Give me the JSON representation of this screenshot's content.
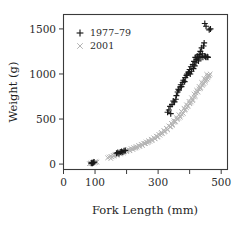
{
  "chart_data": {
    "type": "scatter",
    "title": "",
    "xlabel": "Fork Length (mm)",
    "ylabel": "Weight (g)",
    "xlim": [
      0,
      520
    ],
    "ylim": [
      -60,
      1660
    ],
    "xticks": [
      0,
      100,
      200,
      300,
      400,
      500
    ],
    "xticklabels": [
      "0",
      "100",
      "",
      "300",
      "",
      "500"
    ],
    "yticks": [
      0,
      500,
      1000,
      1500
    ],
    "yticklabels": [
      "0",
      "500",
      "1000",
      "1500"
    ],
    "grid": false,
    "legend_position": "upper-left-inside",
    "series": [
      {
        "name": "1977–79",
        "marker": "plus",
        "color": "#1a1a1a",
        "points": [
          [
            88,
            10
          ],
          [
            90,
            14
          ],
          [
            92,
            8
          ],
          [
            95,
            18
          ],
          [
            97,
            22
          ],
          [
            168,
            120
          ],
          [
            172,
            128
          ],
          [
            176,
            118
          ],
          [
            180,
            135
          ],
          [
            184,
            140
          ],
          [
            188,
            132
          ],
          [
            192,
            148
          ],
          [
            196,
            152
          ],
          [
            330,
            575
          ],
          [
            334,
            600
          ],
          [
            338,
            640
          ],
          [
            340,
            560
          ],
          [
            344,
            660
          ],
          [
            348,
            700
          ],
          [
            352,
            690
          ],
          [
            356,
            720
          ],
          [
            358,
            760
          ],
          [
            362,
            800
          ],
          [
            364,
            830
          ],
          [
            366,
            820
          ],
          [
            370,
            855
          ],
          [
            372,
            880
          ],
          [
            374,
            860
          ],
          [
            378,
            905
          ],
          [
            380,
            930
          ],
          [
            384,
            915
          ],
          [
            386,
            960
          ],
          [
            390,
            985
          ],
          [
            392,
            1000
          ],
          [
            396,
            1020
          ],
          [
            398,
            1010
          ],
          [
            400,
            1050
          ],
          [
            402,
            1000
          ],
          [
            404,
            1080
          ],
          [
            406,
            1030
          ],
          [
            410,
            1105
          ],
          [
            412,
            1060
          ],
          [
            414,
            1140
          ],
          [
            416,
            1090
          ],
          [
            418,
            1185
          ],
          [
            420,
            1125
          ],
          [
            422,
            1160
          ],
          [
            424,
            1200
          ],
          [
            426,
            1180
          ],
          [
            428,
            1145
          ],
          [
            430,
            1215
          ],
          [
            432,
            1190
          ],
          [
            434,
            1250
          ],
          [
            436,
            1185
          ],
          [
            438,
            1290
          ],
          [
            440,
            1225
          ],
          [
            442,
            1185
          ],
          [
            444,
            1310
          ],
          [
            446,
            1345
          ],
          [
            448,
            1200
          ],
          [
            450,
            1190
          ],
          [
            452,
            1185
          ],
          [
            456,
            1190
          ],
          [
            458,
            1185
          ],
          [
            448,
            1560
          ],
          [
            452,
            1530
          ],
          [
            462,
            1490
          ],
          [
            466,
            1500
          ]
        ]
      },
      {
        "name": "2001",
        "marker": "cross",
        "color": "#b4b4b4",
        "points": [
          [
            82,
            5
          ],
          [
            85,
            8
          ],
          [
            87,
            12
          ],
          [
            89,
            6
          ],
          [
            91,
            16
          ],
          [
            93,
            10
          ],
          [
            95,
            20
          ],
          [
            97,
            14
          ],
          [
            99,
            24
          ],
          [
            101,
            18
          ],
          [
            103,
            28
          ],
          [
            106,
            22
          ],
          [
            140,
            70
          ],
          [
            145,
            78
          ],
          [
            150,
            86
          ],
          [
            154,
            80
          ],
          [
            158,
            95
          ],
          [
            162,
            100
          ],
          [
            166,
            110
          ],
          [
            170,
            105
          ],
          [
            174,
            122
          ],
          [
            178,
            118
          ],
          [
            182,
            130
          ],
          [
            186,
            126
          ],
          [
            190,
            140
          ],
          [
            194,
            136
          ],
          [
            198,
            150
          ],
          [
            202,
            146
          ],
          [
            206,
            160
          ],
          [
            210,
            155
          ],
          [
            214,
            172
          ],
          [
            218,
            166
          ],
          [
            222,
            182
          ],
          [
            226,
            176
          ],
          [
            230,
            194
          ],
          [
            234,
            188
          ],
          [
            238,
            206
          ],
          [
            242,
            200
          ],
          [
            246,
            220
          ],
          [
            250,
            212
          ],
          [
            254,
            232
          ],
          [
            258,
            226
          ],
          [
            262,
            246
          ],
          [
            266,
            238
          ],
          [
            270,
            260
          ],
          [
            274,
            252
          ],
          [
            278,
            276
          ],
          [
            282,
            268
          ],
          [
            286,
            292
          ],
          [
            290,
            284
          ],
          [
            294,
            310
          ],
          [
            298,
            300
          ],
          [
            302,
            330
          ],
          [
            306,
            320
          ],
          [
            310,
            352
          ],
          [
            314,
            340
          ],
          [
            318,
            374
          ],
          [
            322,
            362
          ],
          [
            326,
            398
          ],
          [
            330,
            386
          ],
          [
            334,
            424
          ],
          [
            338,
            412
          ],
          [
            342,
            452
          ],
          [
            346,
            440
          ],
          [
            350,
            482
          ],
          [
            354,
            468
          ],
          [
            358,
            514
          ],
          [
            362,
            500
          ],
          [
            366,
            548
          ],
          [
            370,
            534
          ],
          [
            374,
            584
          ],
          [
            378,
            568
          ],
          [
            382,
            620
          ],
          [
            386,
            604
          ],
          [
            390,
            658
          ],
          [
            394,
            640
          ],
          [
            398,
            696
          ],
          [
            402,
            678
          ],
          [
            406,
            736
          ],
          [
            410,
            716
          ],
          [
            414,
            778
          ],
          [
            418,
            756
          ],
          [
            422,
            820
          ],
          [
            426,
            798
          ],
          [
            430,
            862
          ],
          [
            434,
            840
          ],
          [
            438,
            906
          ],
          [
            442,
            884
          ],
          [
            446,
            950
          ],
          [
            450,
            928
          ],
          [
            454,
            996
          ],
          [
            458,
            972
          ],
          [
            150,
            62
          ],
          [
            160,
            88
          ],
          [
            170,
            96
          ],
          [
            180,
            112
          ],
          [
            190,
            124
          ],
          [
            200,
            138
          ],
          [
            210,
            148
          ],
          [
            220,
            164
          ],
          [
            230,
            180
          ],
          [
            240,
            196
          ],
          [
            250,
            206
          ],
          [
            260,
            228
          ],
          [
            270,
            244
          ],
          [
            280,
            262
          ],
          [
            290,
            280
          ],
          [
            300,
            302
          ],
          [
            310,
            336
          ],
          [
            320,
            358
          ],
          [
            330,
            380
          ],
          [
            340,
            416
          ],
          [
            350,
            462
          ],
          [
            360,
            496
          ],
          [
            370,
            520
          ],
          [
            380,
            562
          ],
          [
            390,
            626
          ],
          [
            400,
            670
          ],
          [
            410,
            704
          ],
          [
            420,
            790
          ],
          [
            430,
            834
          ],
          [
            440,
            872
          ],
          [
            450,
            910
          ],
          [
            455,
            944
          ],
          [
            460,
            980
          ],
          [
            465,
            1000
          ],
          [
            345,
            430
          ],
          [
            355,
            474
          ],
          [
            365,
            510
          ],
          [
            375,
            550
          ],
          [
            385,
            596
          ],
          [
            395,
            648
          ],
          [
            405,
            690
          ],
          [
            415,
            744
          ],
          [
            425,
            806
          ],
          [
            435,
            850
          ],
          [
            445,
            894
          ],
          [
            452,
            938
          ],
          [
            458,
            958
          ],
          [
            462,
            986
          ]
        ]
      }
    ]
  },
  "legend": {
    "entries": [
      {
        "label": "1977–79",
        "marker": "plus",
        "color": "#1a1a1a"
      },
      {
        "label": "2001",
        "marker": "cross",
        "color": "#b4b4b4"
      }
    ]
  }
}
